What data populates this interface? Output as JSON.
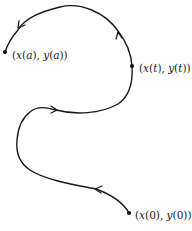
{
  "diagram": {
    "points": [
      {
        "id": "start",
        "label": "(x(0), y(0))",
        "parts": [
          "(",
          "x",
          "(0), ",
          "y",
          "(0))"
        ]
      },
      {
        "id": "middle",
        "label": "(x(t), y(t))",
        "parts": [
          "(",
          "x",
          "(",
          "t",
          "), ",
          "y",
          "(",
          "t",
          "))"
        ]
      },
      {
        "id": "end",
        "label": "(x(a), y(a))",
        "parts": [
          "(",
          "x",
          "(",
          "a",
          "), ",
          "y",
          "(",
          "a",
          "))"
        ]
      }
    ],
    "arrows": 5,
    "colors": {
      "stroke": "#1a1a1a",
      "background": "#ffffff"
    }
  }
}
